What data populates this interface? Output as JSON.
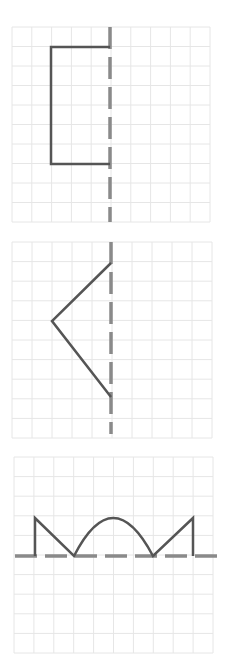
{
  "figure": {
    "colors": {
      "grid": "#e6e6e6",
      "shape": "#555555",
      "axis": "#8a8a8a",
      "background": "#ffffff"
    },
    "panels": [
      {
        "id": "panel-1",
        "axis": "vertical",
        "shape": "bracket",
        "grid": {
          "x": 12,
          "y": 27,
          "width": 198,
          "height": 195,
          "cols": 10,
          "rows": 10
        },
        "axis_line": {
          "x1": 110,
          "y1": 27,
          "x2": 110,
          "y2": 222
        },
        "path": "M110 47 L51 47 L51 164 L110 164"
      },
      {
        "id": "panel-2",
        "axis": "vertical",
        "shape": "chevron",
        "grid": {
          "x": 12,
          "y": 242,
          "width": 200,
          "height": 196,
          "cols": 10,
          "rows": 10
        },
        "axis_line": {
          "x1": 111,
          "y1": 242,
          "x2": 111,
          "y2": 434
        },
        "path": "M111 263 L52 321 L111 397"
      },
      {
        "id": "panel-3",
        "axis": "horizontal",
        "shape": "zigzag-arc",
        "grid": {
          "x": 14,
          "y": 457,
          "width": 199,
          "height": 196,
          "cols": 10,
          "rows": 10
        },
        "axis_line": {
          "x1": 15,
          "y1": 556,
          "x2": 218,
          "y2": 556
        },
        "path": "M35 556 L35 518 L74 556 Q113 480 153 556 L193 518 L193 556"
      }
    ]
  }
}
